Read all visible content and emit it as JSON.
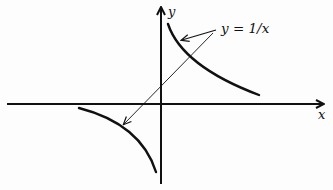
{
  "diagram": {
    "axes": {
      "x_label": "x",
      "y_label": "y"
    },
    "annotation": {
      "text": "y = 1/x",
      "points_to": [
        "upper-right branch",
        "lower-left branch"
      ]
    },
    "curves": [
      {
        "name": "branch-quadrant-1",
        "description": "hyperbola branch in first quadrant"
      },
      {
        "name": "branch-quadrant-3",
        "description": "hyperbola branch in third quadrant"
      }
    ],
    "colors": {
      "ink": "#111111",
      "background": "#fdfdfd"
    }
  }
}
